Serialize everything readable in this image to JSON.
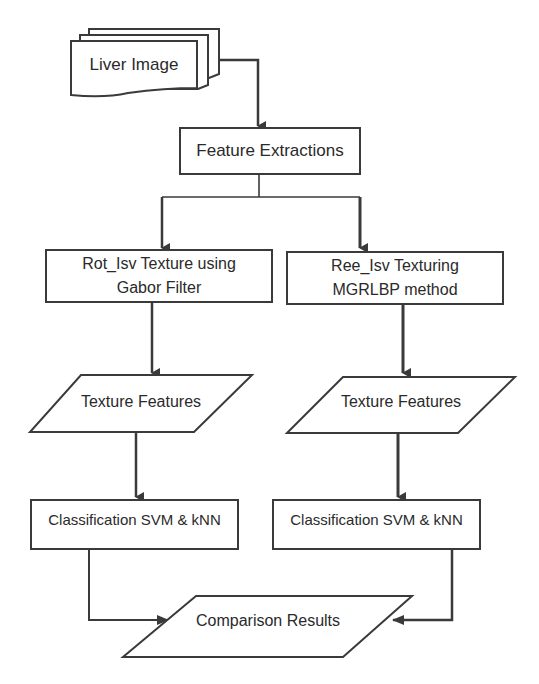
{
  "diagram": {
    "type": "flowchart",
    "nodes": {
      "input": {
        "label": "Liver Image",
        "shape": "multi-document"
      },
      "feature_extraction": {
        "label": "Feature Extractions",
        "shape": "process"
      },
      "left_method": {
        "line1": "Rot_Isv Texture using",
        "line2": "Gabor Filter",
        "shape": "process"
      },
      "right_method": {
        "line1": "Ree_Isv Texturing",
        "line2": "MGRLBP method",
        "shape": "process"
      },
      "left_features": {
        "label": "Texture Features",
        "shape": "data"
      },
      "right_features": {
        "label": "Texture Features",
        "shape": "data"
      },
      "left_classification": {
        "label": "Classification SVM & kNN",
        "shape": "process"
      },
      "right_classification": {
        "label": "Classification SVM & kNN",
        "shape": "process"
      },
      "output": {
        "label": "Comparison Results",
        "shape": "data"
      }
    },
    "edges": [
      [
        "Liver Image",
        "Feature Extractions"
      ],
      [
        "Feature Extractions",
        "Rot_Isv Texture using Gabor Filter"
      ],
      [
        "Feature Extractions",
        "Ree_Isv Texturing MGRLBP method"
      ],
      [
        "Rot_Isv Texture using Gabor Filter",
        "Texture Features (left)"
      ],
      [
        "Ree_Isv Texturing MGRLBP method",
        "Texture Features (right)"
      ],
      [
        "Texture Features (left)",
        "Classification SVM & kNN (left)"
      ],
      [
        "Texture Features (right)",
        "Classification SVM & kNN (right)"
      ],
      [
        "Classification SVM & kNN (left)",
        "Comparison Results"
      ],
      [
        "Classification SVM & kNN (right)",
        "Comparison Results"
      ]
    ],
    "colors": {
      "stroke": "#3a3a3a",
      "text": "#2a2a2a",
      "background": "#ffffff"
    }
  }
}
